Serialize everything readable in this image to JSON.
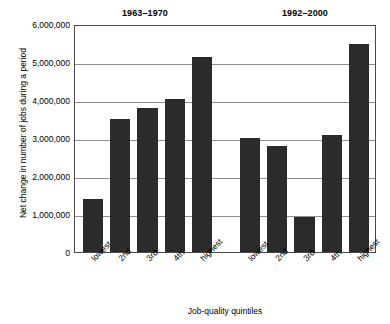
{
  "chart_data": {
    "type": "bar",
    "title": "",
    "xlabel": "Job-quality quintiles",
    "ylabel": "Net change in number of jobs during a period",
    "ylim": [
      0,
      6000000
    ],
    "ytick_values": [
      0,
      1000000,
      2000000,
      3000000,
      4000000,
      5000000,
      6000000
    ],
    "ytick_labels": [
      "0",
      "1,000,000",
      "2,000,000",
      "3,000,000",
      "4,000,000",
      "5,000,000",
      "6,000,000"
    ],
    "grid": "horizontal",
    "legend": "none",
    "categories": [
      "lowest",
      "2nd",
      "3rd",
      "4th",
      "highest"
    ],
    "groups": [
      {
        "name": "1963-1970",
        "label": "1963–1970",
        "categories": [
          "lowest",
          "2nd",
          "3rd",
          "4th",
          "highest"
        ],
        "values": [
          1400000,
          3510000,
          3800000,
          4020000,
          5130000
        ]
      },
      {
        "name": "1992-2000",
        "label": "1992–2000",
        "categories": [
          "lowest",
          "2nd",
          "3rd",
          "4th",
          "highest"
        ],
        "values": [
          3010000,
          2800000,
          920000,
          3070000,
          5480000
        ]
      }
    ],
    "colors": {
      "bar": "#2b2b2b",
      "gridline": "#8f8f8f",
      "frame": "#4a4a4a",
      "background": "#ffffff",
      "text": "#000000"
    }
  }
}
